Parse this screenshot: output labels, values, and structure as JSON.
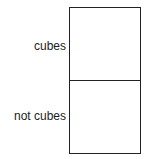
{
  "diagram": {
    "type": "two-cell partition box",
    "cells": [
      {
        "label": "cubes"
      },
      {
        "label": "not cubes"
      }
    ]
  }
}
